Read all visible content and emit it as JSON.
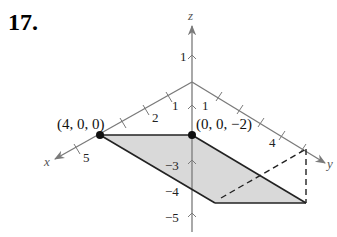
{
  "problem": {
    "number": "17."
  },
  "axes": {
    "x_label": "x",
    "y_label": "y",
    "z_label": "z",
    "x_ticks": [
      "2",
      "5"
    ],
    "y_ticks": [
      "1",
      "4"
    ],
    "z_ticks_positive": [
      "1"
    ],
    "z_ticks_negative": [
      "−3",
      "−4",
      "−5"
    ]
  },
  "points": [
    {
      "label": "(4, 0, 0)"
    },
    {
      "label": "(0, 0, −2)"
    }
  ],
  "colors": {
    "axis": "#7a7a7a",
    "plane_fill": "#d9d9d9",
    "edge": "#222222"
  }
}
